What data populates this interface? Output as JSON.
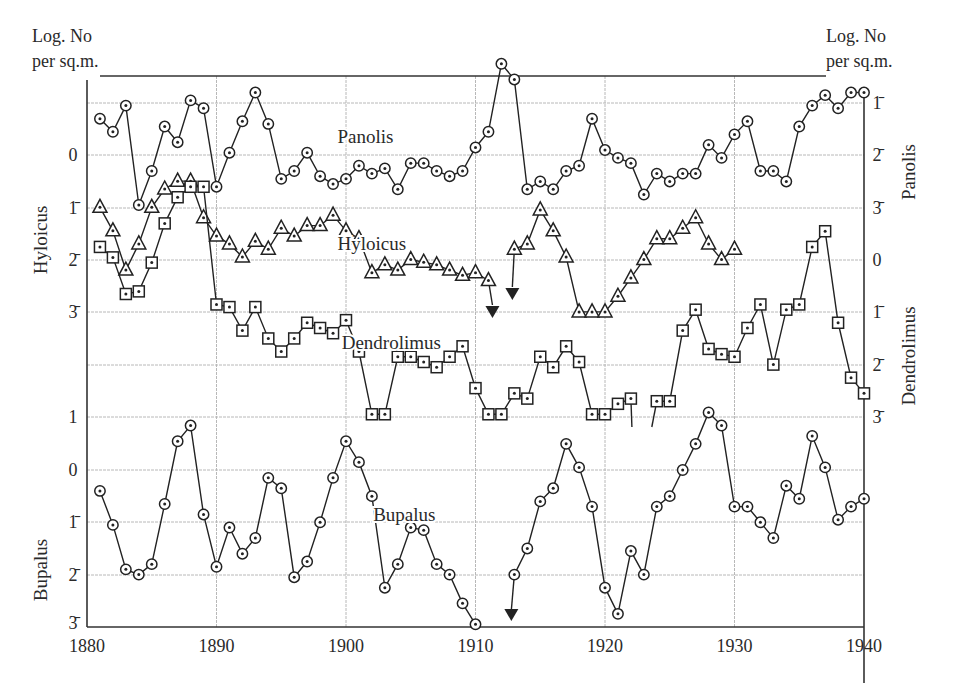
{
  "chart_data": {
    "type": "line",
    "title": "",
    "xlabel": "",
    "ylabel_left": "Log. No per sq.m.",
    "ylabel_right": "Log. No per sq.m.",
    "x_ticks": [
      1880,
      1890,
      1900,
      1910,
      1920,
      1930,
      1940
    ],
    "xlim": [
      1880,
      1940
    ],
    "grid": true,
    "notation": "Bar over digit denotes negative characteristic of logarithm (e.g. 1̄ = -1)",
    "axes": {
      "left_top": {
        "species": "Hyloicus",
        "ticks": [
          "0",
          "1̄",
          "2̄",
          "3̄"
        ]
      },
      "left_bottom": {
        "species": "Bupalus",
        "ticks": [
          "1",
          "0",
          "1̄",
          "2̄",
          "3̄"
        ]
      },
      "right_top": {
        "species": "Panolis",
        "ticks": [
          "1̄",
          "2̄",
          "3̄"
        ]
      },
      "right_bottom": {
        "species": "Dendrolimus",
        "ticks": [
          "0",
          "1̄",
          "2̄",
          "3̄"
        ]
      }
    },
    "series": [
      {
        "name": "Panolis",
        "marker": "circle-dot",
        "axis": "right_top",
        "x": [
          1881,
          1882,
          1883,
          1884,
          1885,
          1886,
          1887,
          1888,
          1889,
          1890,
          1891,
          1892,
          1893,
          1894,
          1895,
          1896,
          1897,
          1898,
          1899,
          1900,
          1901,
          1902,
          1903,
          1904,
          1905,
          1906,
          1907,
          1908,
          1909,
          1910,
          1911,
          1912,
          1913,
          1914,
          1915,
          1916,
          1917,
          1918,
          1919,
          1920,
          1921,
          1922,
          1923,
          1924,
          1925,
          1926,
          1927,
          1928,
          1929,
          1930,
          1931,
          1932,
          1933,
          1934,
          1935,
          1936,
          1937,
          1938,
          1939,
          1940
        ],
        "values": [
          -1.3,
          -1.55,
          -1.05,
          -2.95,
          -2.3,
          -1.45,
          -1.75,
          -0.95,
          -1.1,
          -2.6,
          -1.95,
          -1.35,
          -0.8,
          -1.4,
          -2.45,
          -2.3,
          -1.95,
          -2.4,
          -2.55,
          -2.45,
          -2.2,
          -2.35,
          -2.25,
          -2.65,
          -2.15,
          -2.15,
          -2.3,
          -2.4,
          -2.3,
          -1.85,
          -1.55,
          -0.25,
          -0.55,
          -2.65,
          -2.5,
          -2.65,
          -2.3,
          -2.2,
          -1.3,
          -1.9,
          -2.05,
          -2.15,
          -2.75,
          -2.35,
          -2.5,
          -2.35,
          -2.35,
          -1.8,
          -2.05,
          -1.6,
          -1.35,
          -2.3,
          -2.3,
          -2.5,
          -1.45,
          -1.05,
          -0.85,
          -1.1,
          -0.8,
          -0.8
        ]
      },
      {
        "name": "Hyloicus",
        "marker": "triangle-dot",
        "axis": "left_top",
        "x": [
          1881,
          1882,
          1883,
          1884,
          1885,
          1886,
          1887,
          1888,
          1889,
          1890,
          1891,
          1892,
          1893,
          1894,
          1895,
          1896,
          1897,
          1898,
          1899,
          1900,
          1901,
          1902,
          1903,
          1904,
          1905,
          1906,
          1907,
          1908,
          1909,
          1910,
          1911,
          1913,
          1914,
          1915,
          1916,
          1917,
          1918,
          1919,
          1920,
          1921,
          1922,
          1923,
          1924,
          1925,
          1926,
          1927,
          1928,
          1929,
          1930
        ],
        "values": [
          -1.0,
          -1.45,
          -2.2,
          -1.7,
          -1.0,
          -0.65,
          -0.5,
          -0.5,
          -1.2,
          -1.55,
          -1.7,
          -1.95,
          -1.65,
          -1.8,
          -1.4,
          -1.55,
          -1.35,
          -1.35,
          -1.15,
          -1.45,
          -1.6,
          -2.25,
          -2.1,
          -2.2,
          -2.0,
          -2.05,
          -2.1,
          -2.2,
          -2.3,
          -2.25,
          -2.4,
          -1.8,
          -1.7,
          -1.05,
          -1.45,
          -1.95,
          -3.0,
          -3.0,
          -3.0,
          -2.7,
          -2.35,
          -2.0,
          -1.6,
          -1.6,
          -1.4,
          -1.2,
          -1.7,
          -2.0,
          -1.8
        ],
        "annotations": [
          {
            "x": 1911.5,
            "type": "arrow-down",
            "meaning": "below scale"
          },
          {
            "x": 1912.5,
            "type": "arrow-down",
            "meaning": "below scale"
          }
        ]
      },
      {
        "name": "Dendrolimus",
        "marker": "square-dot",
        "axis": "right_bottom",
        "x": [
          1881,
          1882,
          1883,
          1884,
          1885,
          1886,
          1887,
          1888,
          1889,
          1890,
          1891,
          1892,
          1893,
          1894,
          1895,
          1896,
          1897,
          1898,
          1899,
          1900,
          1901,
          1902,
          1903,
          1904,
          1905,
          1906,
          1907,
          1908,
          1909,
          1910,
          1911,
          1912,
          1913,
          1914,
          1915,
          1916,
          1917,
          1918,
          1919,
          1920,
          1921,
          1922,
          1924,
          1925,
          1926,
          1927,
          1928,
          1929,
          1930,
          1931,
          1932,
          1933,
          1934,
          1935,
          1936,
          1937,
          1938,
          1939,
          1940
        ],
        "values": [
          0.25,
          0.05,
          -0.65,
          -0.6,
          -0.05,
          0.7,
          1.2,
          1.4,
          1.4,
          -0.85,
          -0.9,
          -1.35,
          -0.9,
          -1.5,
          -1.75,
          -1.5,
          -1.2,
          -1.3,
          -1.4,
          -1.15,
          -1.75,
          -2.95,
          -2.95,
          -1.85,
          -1.85,
          -1.95,
          -2.05,
          -1.85,
          -1.65,
          -2.45,
          -2.95,
          -2.95,
          -2.55,
          -2.65,
          -1.85,
          -2.05,
          -1.65,
          -1.95,
          -2.95,
          -2.95,
          -2.75,
          -2.65,
          -2.7,
          -2.7,
          -1.35,
          -0.95,
          -1.7,
          -1.8,
          -1.85,
          -1.3,
          -0.85,
          -2.0,
          -0.95,
          -0.85,
          0.25,
          0.55,
          -1.2,
          -2.25,
          -2.55
        ]
      },
      {
        "name": "Bupalus",
        "marker": "circle-dot",
        "axis": "left_bottom",
        "x": [
          1881,
          1882,
          1883,
          1884,
          1885,
          1886,
          1887,
          1888,
          1889,
          1890,
          1891,
          1892,
          1893,
          1894,
          1895,
          1896,
          1897,
          1898,
          1899,
          1900,
          1901,
          1902,
          1903,
          1904,
          1905,
          1906,
          1907,
          1908,
          1909,
          1910,
          1913,
          1914,
          1915,
          1916,
          1917,
          1918,
          1919,
          1920,
          1921,
          1922,
          1923,
          1924,
          1925,
          1926,
          1927,
          1928,
          1929,
          1930,
          1931,
          1932,
          1933,
          1934,
          1935,
          1936,
          1937,
          1938,
          1939,
          1940
        ],
        "values": [
          -0.4,
          -1.05,
          -1.9,
          -2.0,
          -1.8,
          -0.65,
          0.55,
          0.85,
          -0.85,
          -1.85,
          -1.1,
          -1.6,
          -1.3,
          -0.15,
          -0.35,
          -2.05,
          -1.75,
          -1.0,
          -0.15,
          0.55,
          0.15,
          -0.5,
          -2.25,
          -1.8,
          -1.1,
          -1.15,
          -1.8,
          -2.0,
          -2.55,
          -2.95,
          -2.0,
          -1.5,
          -0.6,
          -0.35,
          0.5,
          0.05,
          -0.7,
          -2.25,
          -2.75,
          -1.55,
          -2.0,
          -0.7,
          -0.5,
          0.0,
          0.5,
          1.1,
          0.85,
          -0.7,
          -0.7,
          -1.0,
          -1.3,
          -0.3,
          -0.55,
          0.65,
          0.05,
          -0.95,
          -0.7,
          -0.55
        ],
        "annotations": [
          {
            "x": 1912.5,
            "type": "arrow-down",
            "meaning": "below scale"
          }
        ]
      }
    ],
    "series_labels": [
      {
        "text": "Panolis",
        "x": 1901.5,
        "y_px": 143
      },
      {
        "text": "Hyloicus",
        "x": 1902,
        "y_px": 250
      },
      {
        "text": "Dendrolimus",
        "x": 1903.5,
        "y_px": 349
      },
      {
        "text": "Bupalus",
        "x": 1904.5,
        "y_px": 521
      }
    ]
  },
  "labels": {
    "left_header_line1": "Log. No",
    "left_header_line2": "per sq.m.",
    "right_header_line1": "Log. No",
    "right_header_line2": "per sq.m.",
    "hyloicus_axis": "Hyloicus",
    "bupalus_axis": "Bupalus",
    "panolis_axis": "Panolis",
    "dendrolimus_axis": "Dendrolimus"
  },
  "colors": {
    "line": "#222222",
    "grid": "#b8b8b8",
    "axis": "#333333",
    "background": "#ffffff"
  }
}
